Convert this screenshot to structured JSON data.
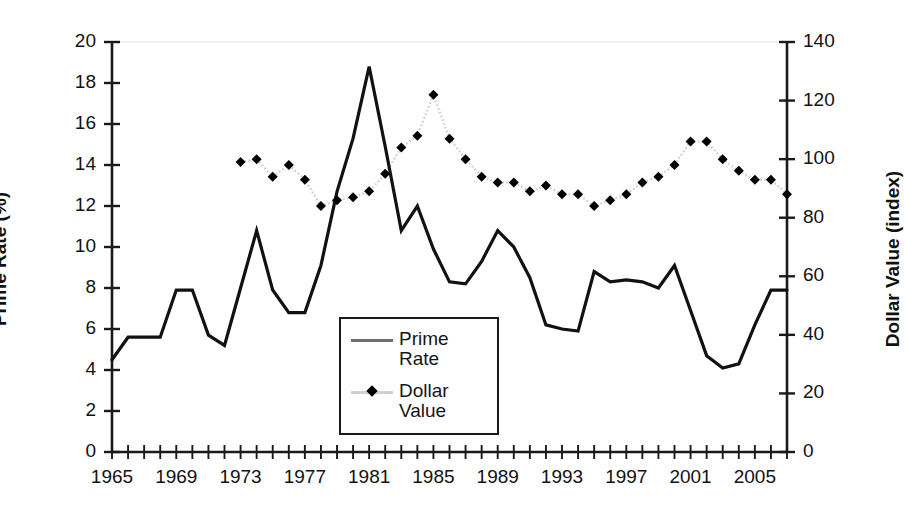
{
  "chart_data": {
    "type": "line",
    "title": "",
    "xlabel": "",
    "grid": false,
    "legend_position": "inside-center-bottom",
    "x_axis": {
      "label": "",
      "ticks_every": 1,
      "labels_every": 4,
      "range": [
        1965,
        2007
      ],
      "tick_labels": [
        "1965",
        "1969",
        "1973",
        "1977",
        "1981",
        "1985",
        "1989",
        "1993",
        "1997",
        "2001",
        "2005"
      ],
      "tick_label_years": [
        1965,
        1969,
        1973,
        1977,
        1981,
        1985,
        1989,
        1993,
        1997,
        2001,
        2005
      ]
    },
    "y_axis_left": {
      "label": "Prime Rate (%)",
      "ylim": [
        0,
        20
      ],
      "tick_step": 2,
      "tick_labels": [
        "0",
        "2",
        "4",
        "6",
        "8",
        "10",
        "12",
        "14",
        "16",
        "18",
        "20"
      ],
      "tick_values": [
        0,
        2,
        4,
        6,
        8,
        10,
        12,
        14,
        16,
        18,
        20
      ]
    },
    "y_axis_right": {
      "label": "Dollar Value (index)",
      "ylim": [
        0,
        140
      ],
      "tick_step": 20,
      "tick_labels": [
        "0",
        "20",
        "40",
        "60",
        "80",
        "100",
        "120",
        "140"
      ],
      "tick_values": [
        0,
        20,
        40,
        60,
        80,
        100,
        120,
        140
      ]
    },
    "series": [
      {
        "name": "Prime Rate",
        "legend_label": "Prime\nRate",
        "axis": "left",
        "style": "solid-line",
        "color": "#111111",
        "marker": "none",
        "x": [
          1965,
          1966,
          1967,
          1968,
          1969,
          1970,
          1971,
          1972,
          1973,
          1974,
          1975,
          1976,
          1977,
          1978,
          1979,
          1980,
          1981,
          1982,
          1983,
          1984,
          1985,
          1986,
          1987,
          1988,
          1989,
          1990,
          1991,
          1992,
          1993,
          1994,
          1995,
          1996,
          1997,
          1998,
          1999,
          2000,
          2001,
          2002,
          2003,
          2004,
          2005,
          2006,
          2007
        ],
        "values": [
          4.5,
          5.6,
          5.6,
          5.6,
          7.9,
          7.9,
          5.7,
          5.2,
          8.0,
          10.8,
          7.9,
          6.8,
          6.8,
          9.1,
          12.7,
          15.3,
          18.8,
          14.9,
          10.8,
          12.0,
          9.9,
          8.3,
          8.2,
          9.3,
          10.8,
          10.0,
          8.5,
          6.2,
          6.0,
          5.9,
          8.8,
          8.3,
          8.4,
          8.3,
          8.0,
          9.1,
          6.9,
          4.7,
          4.1,
          4.3,
          6.2,
          7.9,
          7.9
        ]
      },
      {
        "name": "Dollar Value",
        "legend_label": "Dollar\nValue",
        "axis": "right",
        "style": "dotted-line",
        "color": "#000000",
        "line_color": "#cccccc",
        "marker": "diamond",
        "x": [
          1973,
          1974,
          1975,
          1976,
          1977,
          1978,
          1979,
          1980,
          1981,
          1982,
          1983,
          1984,
          1985,
          1986,
          1987,
          1988,
          1989,
          1990,
          1991,
          1992,
          1993,
          1994,
          1995,
          1996,
          1997,
          1998,
          1999,
          2000,
          2001,
          2002,
          2003,
          2004,
          2005,
          2006,
          2007
        ],
        "values": [
          99,
          100,
          94,
          98,
          93,
          84,
          86,
          87,
          89,
          95,
          104,
          108,
          122,
          107,
          100,
          94,
          92,
          92,
          89,
          91,
          88,
          88,
          84,
          86,
          88,
          92,
          94,
          98,
          106,
          106,
          100,
          96,
          93,
          93,
          88
        ]
      }
    ]
  },
  "axis_titles": {
    "left": "Prime Rate (%)",
    "right": "Dollar Value (index)"
  },
  "legend": {
    "entries": [
      {
        "label": "Prime\nRate",
        "marker": "line-swatch"
      },
      {
        "label": "Dollar\nValue",
        "marker": "diamond-swatch"
      }
    ]
  },
  "colors": {
    "line": "#111111",
    "marker": "#000000",
    "dotted_connector": "#cccccc",
    "axis": "#1a1a1a",
    "background": "#ffffff",
    "faint_gridline": "#ededed"
  }
}
